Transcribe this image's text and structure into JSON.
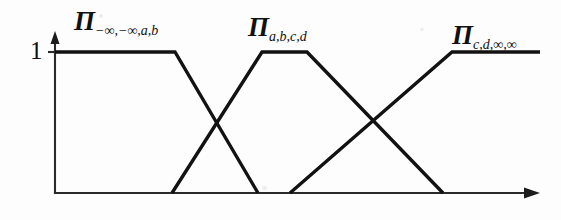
{
  "figure": {
    "background_color": "#fdfdfd",
    "line_color": "#121212",
    "axis_color": "#2b2b2b"
  },
  "axes": {
    "y_axis": {
      "name": "membership-axis",
      "tick_labels": [
        "1"
      ],
      "tick_value_one": "1",
      "origin_x": 55,
      "top_y": 33,
      "bottom_y": 193,
      "level_one_y": 52,
      "has_arrow": true
    },
    "x_axis": {
      "name": "domain-axis",
      "label": "",
      "start_x": 55,
      "end_x": 540,
      "y": 193,
      "has_arrow": true,
      "tick_labels": []
    }
  },
  "labels": {
    "left": {
      "symbol": "Π",
      "subscript": "−∞,−∞,a,b",
      "full": "Π−∞,−∞,a,b"
    },
    "middle": {
      "symbol": "Π",
      "subscript": "a,b,c,d",
      "full": "Πa,b,c,d"
    },
    "right": {
      "symbol": "Π",
      "subscript": "c,d,∞,∞",
      "full": "Πc,d,∞,∞"
    }
  },
  "chart_data": {
    "type": "line",
    "title": "",
    "xlabel": "",
    "ylabel": "",
    "xlim": [
      55,
      540
    ],
    "ylim": [
      0,
      1
    ],
    "grid": false,
    "legend": "none",
    "y_tick_values": [
      1
    ],
    "y_tick_labels": [
      "1"
    ],
    "x_tick_values": [],
    "x_tick_labels": [],
    "series": [
      {
        "name": "Π−∞,−∞,a,b",
        "label_position": "top-left",
        "shape": "left-shoulder-trapezoid",
        "points_px": [
          [
            55,
            52
          ],
          [
            175,
            52
          ],
          [
            258,
            193
          ]
        ],
        "breakpoints": [
          "-inf",
          "-inf",
          "a",
          "b"
        ],
        "values": [
          1,
          1,
          1,
          0
        ]
      },
      {
        "name": "Πa,b,c,d",
        "label_position": "top-center",
        "shape": "trapezoid",
        "points_px": [
          [
            172,
            193
          ],
          [
            262,
            52
          ],
          [
            307,
            52
          ],
          [
            443,
            193
          ]
        ],
        "breakpoints": [
          "a",
          "b",
          "c",
          "d"
        ],
        "values": [
          0,
          1,
          1,
          0
        ]
      },
      {
        "name": "Πc,d,∞,∞",
        "label_position": "top-right",
        "shape": "right-shoulder-trapezoid",
        "points_px": [
          [
            290,
            193
          ],
          [
            452,
            52
          ],
          [
            540,
            52
          ]
        ],
        "breakpoints": [
          "c",
          "d",
          "inf",
          "inf"
        ],
        "values": [
          0,
          1,
          1,
          1
        ]
      }
    ]
  }
}
